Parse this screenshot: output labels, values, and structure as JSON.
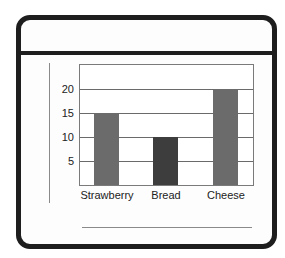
{
  "chart_data": {
    "type": "bar",
    "title": "",
    "xlabel": "",
    "ylabel": "",
    "categories": [
      "Strawberry",
      "Bread",
      "Cheese"
    ],
    "values": [
      15,
      10,
      20
    ],
    "colors": [
      "#6b6b6b",
      "#3d3d3d",
      "#6b6b6b"
    ],
    "ylim": [
      0,
      25
    ],
    "yticks": [
      5,
      10,
      15,
      20
    ],
    "grid": true,
    "legend": null
  },
  "axis": {
    "ytick_labels": [
      "20",
      "15",
      "10",
      "5"
    ]
  },
  "labels": {
    "cat0": "Strawberry",
    "cat1": "Bread",
    "cat2": "Cheese"
  }
}
